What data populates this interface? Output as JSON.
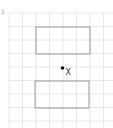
{
  "diagram": {
    "corner_mark": "1",
    "grid": {
      "x0": 9,
      "y0": 13,
      "step": 13.5,
      "cols": 8,
      "rows": 9,
      "color": "#e2e2e2"
    },
    "rectangles": [
      {
        "name": "upper-rectangle",
        "x": 36,
        "y": 27,
        "w": 54,
        "h": 27,
        "stroke": "#9a9a9a"
      },
      {
        "name": "lower-rectangle",
        "x": 35,
        "y": 81,
        "w": 54,
        "h": 27,
        "stroke": "#9a9a9a"
      }
    ],
    "point": {
      "label": "X",
      "x": 62.5,
      "y": 68,
      "color": "#111111"
    }
  }
}
